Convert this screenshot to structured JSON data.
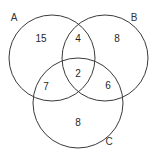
{
  "figure": {
    "background_color": "#ffffff",
    "stroke_color": "#3a3a3a",
    "text_color": "#1f1f1f"
  },
  "chart_data": {
    "type": "diagram",
    "diagram_type": "venn",
    "set_count": 3,
    "title": "",
    "sets": [
      {
        "id": "A",
        "label": "A",
        "label_x": 14,
        "label_y": 18,
        "cx": 52,
        "cy": 58,
        "r": 43
      },
      {
        "id": "B",
        "label": "B",
        "label_x": 134,
        "label_y": 18,
        "cx": 105,
        "cy": 58,
        "r": 43
      },
      {
        "id": "C",
        "label": "C",
        "label_x": 109,
        "label_y": 142,
        "cx": 78,
        "cy": 103,
        "r": 45
      }
    ],
    "regions": [
      {
        "id": "A_only",
        "sets": [
          "A"
        ],
        "value": "15",
        "x": 41,
        "y": 39
      },
      {
        "id": "AB",
        "sets": [
          "A",
          "B"
        ],
        "value": "4",
        "x": 78,
        "y": 39
      },
      {
        "id": "B_only",
        "sets": [
          "B"
        ],
        "value": "8",
        "x": 117,
        "y": 39
      },
      {
        "id": "AC",
        "sets": [
          "A",
          "C"
        ],
        "value": "7",
        "x": 46,
        "y": 87
      },
      {
        "id": "ABC",
        "sets": [
          "A",
          "B",
          "C"
        ],
        "value": "2",
        "x": 78,
        "y": 74
      },
      {
        "id": "BC",
        "sets": [
          "B",
          "C"
        ],
        "value": "6",
        "x": 108,
        "y": 86
      },
      {
        "id": "C_only",
        "sets": [
          "C"
        ],
        "value": "8",
        "x": 78,
        "y": 123
      }
    ],
    "xlim": [
      0,
      157
    ],
    "ylim": [
      0,
      162
    ],
    "grid": false,
    "legend": "none"
  }
}
